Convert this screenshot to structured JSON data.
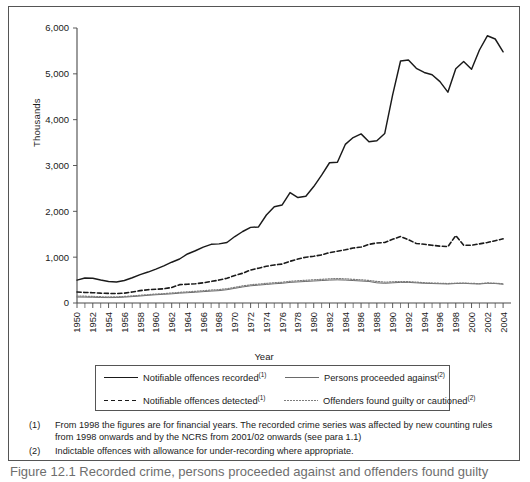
{
  "figure": {
    "y_axis_title": "Thousands",
    "x_axis_title": "Year",
    "caption": "Figure 12.1  Recorded crime, persons proceeded against and offenders found guilty"
  },
  "legend": {
    "entries": [
      {
        "label": "Notifiable offences recorded",
        "footnote": "(1)",
        "style": "sw-solid",
        "name": "notifiable-offences-recorded"
      },
      {
        "label": "Persons proceeded against",
        "footnote": "(2)",
        "style": "sw-solid-thin",
        "name": "persons-proceeded-against"
      },
      {
        "label": "Notifiable offences detected",
        "footnote": "(1)",
        "style": "sw-dash",
        "name": "notifiable-offences-detected"
      },
      {
        "label": "Offenders found guilty or cautioned",
        "footnote": "(2)",
        "style": "sw-dot",
        "name": "offenders-found-guilty-or-cautioned"
      }
    ]
  },
  "notes": [
    {
      "num": "(1)",
      "text": "From 1998 the figures are for financial years. The recorded crime series was affected by new counting rules from 1998 onwards and by the NCRS from 2001/02 onwards (see para 1.1)"
    },
    {
      "num": "(2)",
      "text": "Indictable offences with allowance for under-recording where appropriate."
    }
  ],
  "chart_data": {
    "type": "line",
    "title": "",
    "xlabel": "Year",
    "ylabel": "Thousands",
    "xlim": [
      1950,
      2005
    ],
    "ylim": [
      0,
      6000
    ],
    "yticks": [
      0,
      1000,
      2000,
      3000,
      4000,
      5000,
      6000
    ],
    "ytick_labels": [
      "0",
      "1,000",
      "2,000",
      "3,000",
      "4,000",
      "5,000",
      "6,000"
    ],
    "xticks": [
      1950,
      1952,
      1954,
      1956,
      1958,
      1960,
      1962,
      1964,
      1966,
      1968,
      1970,
      1972,
      1974,
      1976,
      1978,
      1980,
      1982,
      1984,
      1986,
      1988,
      1990,
      1992,
      1994,
      1996,
      1998,
      2000,
      2002,
      2004
    ],
    "minor_tick_every": 1,
    "grid": false,
    "legend_position": "below",
    "x": [
      1950,
      1951,
      1952,
      1953,
      1954,
      1955,
      1956,
      1957,
      1958,
      1959,
      1960,
      1961,
      1962,
      1963,
      1964,
      1965,
      1966,
      1967,
      1968,
      1969,
      1970,
      1971,
      1972,
      1973,
      1974,
      1975,
      1976,
      1977,
      1978,
      1979,
      1980,
      1981,
      1982,
      1983,
      1984,
      1985,
      1986,
      1987,
      1988,
      1989,
      1990,
      1991,
      1992,
      1993,
      1994,
      1995,
      1996,
      1997,
      1998,
      1999,
      2000,
      2001,
      2002,
      2003,
      2004
    ],
    "series": [
      {
        "name": "Notifiable offences recorded",
        "footnote": "(1)",
        "style": "solid",
        "color": "#1a1a1a",
        "values": [
          500,
          545,
          540,
          500,
          470,
          460,
          490,
          550,
          620,
          675,
          740,
          810,
          890,
          960,
          1070,
          1140,
          1220,
          1280,
          1290,
          1320,
          1450,
          1560,
          1650,
          1660,
          1920,
          2100,
          2140,
          2410,
          2300,
          2330,
          2540,
          2790,
          3060,
          3070,
          3460,
          3610,
          3690,
          3520,
          3540,
          3700,
          4540,
          5280,
          5300,
          5120,
          5030,
          4980,
          4830,
          4600,
          5110,
          5270,
          5100,
          5520,
          5830,
          5760,
          5480
        ]
      },
      {
        "name": "Notifiable offences detected",
        "footnote": "(1)",
        "style": "dashed",
        "color": "#1a1a1a",
        "values": [
          240,
          230,
          225,
          215,
          210,
          205,
          215,
          240,
          270,
          290,
          300,
          310,
          340,
          400,
          410,
          420,
          440,
          470,
          500,
          540,
          600,
          650,
          720,
          760,
          800,
          830,
          850,
          910,
          960,
          1000,
          1020,
          1050,
          1100,
          1130,
          1160,
          1200,
          1220,
          1280,
          1310,
          1320,
          1390,
          1450,
          1380,
          1300,
          1280,
          1260,
          1240,
          1230,
          1470,
          1260,
          1260,
          1290,
          1320,
          1360,
          1400
        ]
      },
      {
        "name": "Persons proceeded against",
        "footnote": "(2)",
        "style": "solid-thin",
        "color": "#6a6a6a",
        "values": [
          130,
          128,
          125,
          120,
          118,
          120,
          128,
          140,
          152,
          168,
          180,
          190,
          200,
          215,
          225,
          235,
          248,
          260,
          270,
          290,
          320,
          350,
          375,
          390,
          405,
          420,
          430,
          450,
          460,
          470,
          480,
          490,
          500,
          505,
          500,
          490,
          480,
          470,
          440,
          430,
          440,
          450,
          450,
          440,
          430,
          425,
          420,
          415,
          425,
          430,
          420,
          415,
          430,
          425,
          410
        ]
      },
      {
        "name": "Offenders found guilty or cautioned",
        "footnote": "(2)",
        "style": "dotted",
        "color": "#7d7d7d",
        "values": [
          150,
          148,
          143,
          137,
          132,
          134,
          142,
          155,
          168,
          182,
          195,
          205,
          218,
          232,
          243,
          255,
          268,
          282,
          292,
          312,
          340,
          372,
          398,
          412,
          428,
          442,
          452,
          472,
          485,
          495,
          505,
          516,
          528,
          532,
          528,
          516,
          505,
          492,
          470,
          455,
          462,
          468,
          466,
          455,
          442,
          436,
          430,
          424,
          432,
          436,
          428,
          422,
          438,
          432,
          418
        ]
      }
    ]
  }
}
